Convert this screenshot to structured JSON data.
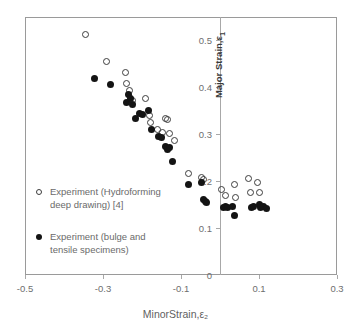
{
  "chart_data": {
    "type": "scatter",
    "title": "",
    "xlabel": "MinorStrain,ε₂",
    "ylabel": "Major Strain,ε₁",
    "xlim": [
      -0.5,
      0.3
    ],
    "ylim": [
      0.0,
      0.55
    ],
    "xticks": [
      -0.5,
      -0.3,
      -0.1,
      0.1,
      0.3
    ],
    "xtick_labels": [
      "-0.5",
      "-0.3",
      "-0.1",
      "0.1",
      "0.3"
    ],
    "yticks": [
      0,
      0.1,
      0.2,
      0.3,
      0.4,
      0.5
    ],
    "ytick_labels": [
      "0",
      "0.1",
      "0.2",
      "0.3",
      "0.4",
      "0.5"
    ],
    "grid": false,
    "legend_position": "inside-lower-left",
    "value_axis_at_x": 0,
    "series": [
      {
        "name": "Experiment (Hydroforming deep drawing) [4]",
        "marker": "open-circle",
        "color": "#3d3d3d",
        "points": [
          [
            -0.345,
            0.512
          ],
          [
            -0.292,
            0.456
          ],
          [
            -0.243,
            0.432
          ],
          [
            -0.24,
            0.408
          ],
          [
            -0.232,
            0.393
          ],
          [
            -0.225,
            0.372
          ],
          [
            -0.192,
            0.377
          ],
          [
            -0.182,
            0.34
          ],
          [
            -0.178,
            0.325
          ],
          [
            -0.16,
            0.311
          ],
          [
            -0.148,
            0.304
          ],
          [
            -0.14,
            0.334
          ],
          [
            -0.134,
            0.331
          ],
          [
            -0.13,
            0.302
          ],
          [
            -0.117,
            0.287
          ],
          [
            -0.08,
            0.216
          ],
          [
            -0.048,
            0.207
          ],
          [
            -0.042,
            0.203
          ],
          [
            0.005,
            0.182
          ],
          [
            0.015,
            0.17
          ],
          [
            0.037,
            0.192
          ],
          [
            0.04,
            0.166
          ],
          [
            0.072,
            0.205
          ],
          [
            0.078,
            0.176
          ],
          [
            0.095,
            0.198
          ],
          [
            0.1,
            0.175
          ]
        ]
      },
      {
        "name": "Experiment (bulge and tensile specimens)",
        "marker": "filled-circle",
        "color": "#141414",
        "points": [
          [
            -0.322,
            0.418
          ],
          [
            -0.281,
            0.406
          ],
          [
            -0.24,
            0.367
          ],
          [
            -0.234,
            0.384
          ],
          [
            -0.23,
            0.377
          ],
          [
            -0.224,
            0.363
          ],
          [
            -0.216,
            0.333
          ],
          [
            -0.206,
            0.345
          ],
          [
            -0.2,
            0.343
          ],
          [
            -0.183,
            0.35
          ],
          [
            -0.175,
            0.311
          ],
          [
            -0.157,
            0.296
          ],
          [
            -0.15,
            0.293
          ],
          [
            -0.139,
            0.275
          ],
          [
            -0.135,
            0.268
          ],
          [
            -0.13,
            0.271
          ],
          [
            -0.122,
            0.243
          ],
          [
            -0.082,
            0.193
          ],
          [
            -0.048,
            0.197
          ],
          [
            -0.042,
            0.162
          ],
          [
            -0.038,
            0.157
          ],
          [
            -0.034,
            0.154
          ],
          [
            0.009,
            0.143
          ],
          [
            0.015,
            0.145
          ],
          [
            0.018,
            0.144
          ],
          [
            0.033,
            0.145
          ],
          [
            0.036,
            0.126
          ],
          [
            0.081,
            0.144
          ],
          [
            0.086,
            0.146
          ],
          [
            0.1,
            0.15
          ],
          [
            0.104,
            0.143
          ],
          [
            0.112,
            0.146
          ],
          [
            0.12,
            0.141
          ]
        ]
      }
    ]
  },
  "axes": {
    "x_title": "MinorStrain,ε₂",
    "y_title_main": "Major Strain,",
    "y_title_symbol": "ε",
    "y_title_subscript": "1"
  },
  "legend": {
    "items": [
      {
        "marker": "open-circle",
        "line1": "Experiment (Hydroforming",
        "line2": "deep drawing) [4]"
      },
      {
        "marker": "filled-circle",
        "line1": "Experiment (bulge and",
        "line2": "tensile specimens)"
      }
    ]
  },
  "colors": {
    "frame": "#9a9a9a",
    "axis": "#a8a8a8",
    "tick_text": "#6e6e6e",
    "open_marker": "#3d3d3d",
    "filled_marker": "#141414",
    "background": "#ffffff"
  }
}
